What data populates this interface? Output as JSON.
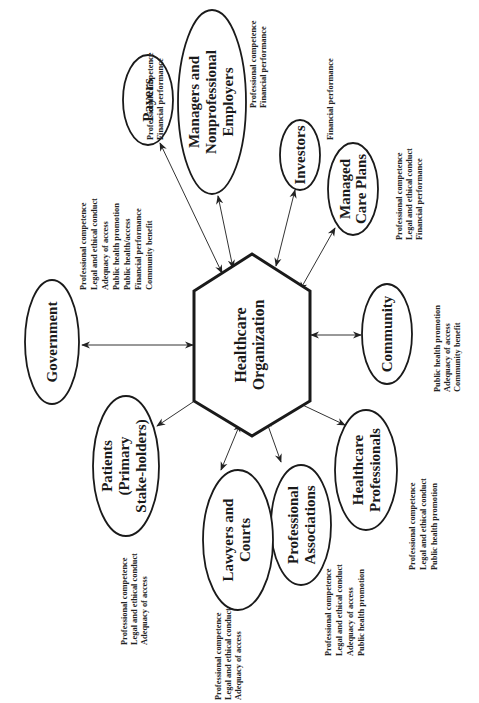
{
  "diagram": {
    "orientation": "rotated 90° counter-clockwise (text reads bottom-to-top)",
    "hub": {
      "label_lines": [
        "Healthcare",
        "Organization"
      ]
    },
    "stakeholders": [
      {
        "id": "payers",
        "label_lines": [
          "Payers"
        ],
        "notes": [
          "Professional competence",
          "Financial performance"
        ]
      },
      {
        "id": "managers",
        "label_lines": [
          "Managers and",
          "Nonprofessional",
          "Employers"
        ],
        "notes": [
          "Professional competence",
          "Financial performance"
        ]
      },
      {
        "id": "investors",
        "label_lines": [
          "Investors"
        ],
        "notes": [
          "Financial performance"
        ]
      },
      {
        "id": "managed-care",
        "label_lines": [
          "Managed",
          "Care Plans"
        ],
        "notes": [
          "Professional competence",
          "Legal and ethical conduct",
          "Financial performance"
        ]
      },
      {
        "id": "community",
        "label_lines": [
          "Community"
        ],
        "notes": [
          "Public health promotion",
          "Adequacy of access",
          "Community benefit"
        ]
      },
      {
        "id": "healthcare-professionals",
        "label_lines": [
          "Healthcare",
          "Professionals"
        ],
        "notes": [
          "Professional competence",
          "Legal and ethical conduct",
          "Public health promotion"
        ]
      },
      {
        "id": "professional-associations",
        "label_lines": [
          "Professional",
          "Associations"
        ],
        "notes": [
          "Professional competence",
          "Legal and ethical conduct",
          "Adequacy of access",
          "Public health promotion"
        ]
      },
      {
        "id": "lawyers",
        "label_lines": [
          "Lawyers and",
          "Courts"
        ],
        "notes": [
          "Professional competence",
          "Legal and ethical conduct",
          "Adequacy of access"
        ]
      },
      {
        "id": "patients",
        "label_lines": [
          "Patients",
          "(Primary",
          "Stake-holders)"
        ],
        "notes": [
          "Professional competence",
          "Legal and ethical conduct",
          "Adequacy of access"
        ]
      },
      {
        "id": "government",
        "label_lines": [
          "Government"
        ],
        "notes": [
          "Professional competence",
          "Legal and ethical conduct",
          "Adequacy of access",
          "Public health promotion",
          "Public health/access",
          "Financial performance",
          "Community benefit"
        ]
      }
    ]
  }
}
